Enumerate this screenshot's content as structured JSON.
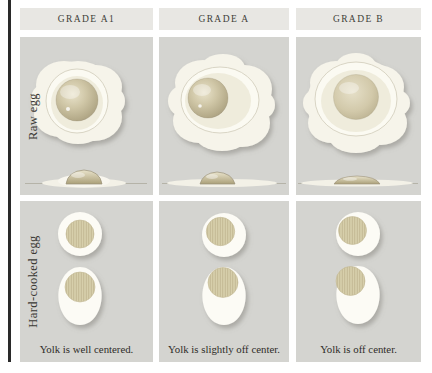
{
  "columns": [
    {
      "grade_label": "GRADE A1",
      "caption": "Yolk is well centered."
    },
    {
      "grade_label": "GRADE A",
      "caption": "Yolk is slightly off center."
    },
    {
      "grade_label": "GRADE B",
      "caption": "Yolk is off center."
    }
  ],
  "row_labels": {
    "raw": "Raw egg",
    "cooked": "Hard-cooked egg"
  },
  "colors": {
    "page_bg": "#ffffff",
    "panel_bg": "#d4d4d0",
    "header_bg": "#e8e7e3",
    "egg_white": "#f6f4ea",
    "ring_white": "#fbfaf2",
    "raw_yolk": "#c6bc9c",
    "cooked_yolk": "#d7cfab",
    "hatch_line": "#b9ad88",
    "surface_line": "#b5b3a8",
    "text": "#2e2c28",
    "rule": "#2a2a2a"
  }
}
